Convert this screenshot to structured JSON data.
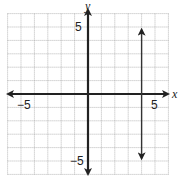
{
  "chart_data": {
    "type": "line",
    "title": "",
    "xlabel": "x",
    "ylabel": "y",
    "xlim": [
      -6,
      6
    ],
    "ylim": [
      -6,
      6
    ],
    "grid": true,
    "grid_step": 1,
    "tick_labels": {
      "x": [
        {
          "value": -5,
          "label": "−5"
        },
        {
          "value": 5,
          "label": "5"
        }
      ],
      "y": [
        {
          "value": 5,
          "label": "5"
        },
        {
          "value": -5,
          "label": "−5"
        }
      ]
    },
    "series": [
      {
        "name": "x = 4",
        "description": "vertical line",
        "x": [
          4,
          4
        ],
        "y": [
          4.8,
          -4.8
        ],
        "arrows": "both"
      }
    ]
  }
}
